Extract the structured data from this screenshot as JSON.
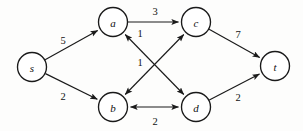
{
  "diagram": {
    "background_color": "#fdfdfc",
    "stroke_color": "#1a1a1a",
    "node_fill": "#ffffff",
    "node_radius": 14.5,
    "nodes": [
      {
        "id": "s",
        "label": "s",
        "x": 32,
        "y": 67
      },
      {
        "id": "a",
        "label": "a",
        "x": 113,
        "y": 22
      },
      {
        "id": "c",
        "label": "c",
        "x": 196,
        "y": 22
      },
      {
        "id": "b",
        "label": "b",
        "x": 113,
        "y": 107
      },
      {
        "id": "d",
        "label": "d",
        "x": 196,
        "y": 107
      },
      {
        "id": "t",
        "label": "t",
        "x": 275,
        "y": 66
      }
    ],
    "edges": [
      {
        "id": "s-a",
        "from": "s",
        "to": "a",
        "weight": "5",
        "directed": "forward",
        "label_x": 63,
        "label_y": 40
      },
      {
        "id": "s-b",
        "from": "s",
        "to": "b",
        "weight": "2",
        "directed": "forward",
        "label_x": 63,
        "label_y": 96
      },
      {
        "id": "a-c",
        "from": "a",
        "to": "c",
        "weight": "3",
        "directed": "forward",
        "label_x": 155,
        "label_y": 11
      },
      {
        "id": "a-d",
        "from": "a",
        "to": "d",
        "weight": "1",
        "directed": "both",
        "label_x": 140,
        "label_y": 33
      },
      {
        "id": "b-c",
        "from": "b",
        "to": "c",
        "weight": "1",
        "directed": "both",
        "label_x": 140,
        "label_y": 62
      },
      {
        "id": "b-d",
        "from": "b",
        "to": "d",
        "weight": "2",
        "directed": "both",
        "label_x": 155,
        "label_y": 121
      },
      {
        "id": "c-t",
        "from": "c",
        "to": "t",
        "weight": "7",
        "directed": "forward",
        "label_x": 238,
        "label_y": 34
      },
      {
        "id": "d-t",
        "from": "d",
        "to": "t",
        "weight": "2",
        "directed": "forward",
        "label_x": 238,
        "label_y": 97
      }
    ]
  }
}
